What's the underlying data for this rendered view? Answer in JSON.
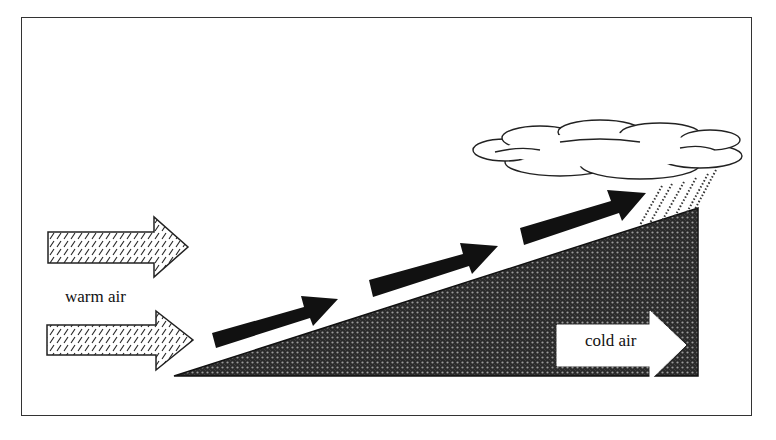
{
  "diagram": {
    "labels": {
      "warm_air": "warm air",
      "cold_air": "cold air"
    },
    "elements": {
      "warm_air_arrows": 2,
      "rising_air_arrows": 3,
      "cloud": "cloud with rain",
      "cold_air_wedge": "cold air mass (sloped frontal surface)"
    },
    "colors": {
      "ink": "#111111",
      "background": "#ffffff",
      "wedge_fill": "#3a3a3a"
    }
  }
}
